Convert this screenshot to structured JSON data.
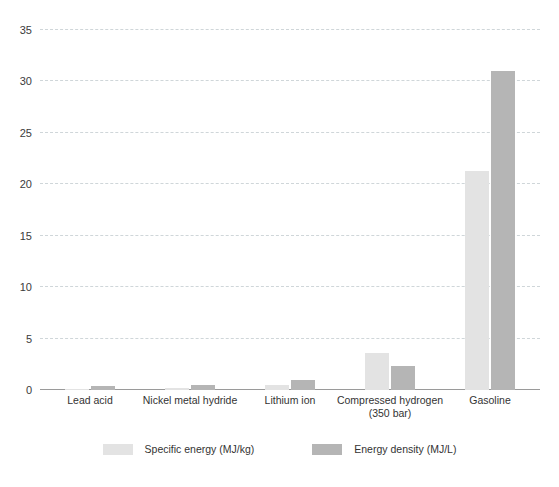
{
  "chart_data": {
    "type": "bar",
    "title": "",
    "subtitle": "",
    "xlabel": "",
    "ylabel": "",
    "ylim": [
      0,
      35
    ],
    "yticks": [
      0,
      5,
      10,
      15,
      20,
      25,
      30,
      35
    ],
    "ytick_labels": [
      "0",
      "5",
      "10",
      "15",
      "20",
      "25",
      "30",
      "35"
    ],
    "grid": true,
    "grid_axis": "y",
    "grid_style": "dashed",
    "legend_position": "bottom",
    "categories": [
      "Lead acid",
      "Nickel metal hydride",
      "Lithium ion",
      "Compressed hydrogen (350 bar)",
      "Gasoline"
    ],
    "category_labels": [
      {
        "line1": "Lead acid",
        "line2": ""
      },
      {
        "line1": "Nickel metal hydride",
        "line2": ""
      },
      {
        "line1": "Lithium ion",
        "line2": ""
      },
      {
        "line1": "Compressed hydrogen",
        "line2": "(350 bar)"
      },
      {
        "line1": "Gasoline",
        "line2": ""
      }
    ],
    "series": [
      {
        "name": "Specific energy (MJ/kg)",
        "color": "#e3e3e3",
        "values": [
          0.14,
          0.22,
          0.46,
          3.6,
          21.3
        ]
      },
      {
        "name": "Energy density (MJ/L)",
        "color": "#b5b5b5",
        "values": [
          0.36,
          0.5,
          1.0,
          2.3,
          31.0
        ]
      }
    ]
  },
  "legend": {
    "items": [
      {
        "label": "Specific energy (MJ/kg)",
        "color": "#e3e3e3"
      },
      {
        "label": "Energy density (MJ/L)",
        "color": "#b5b5b5"
      }
    ]
  },
  "style": {
    "background": "#ffffff",
    "gridline_color": "#cfd6d9",
    "baseline_color": "#9a9a9a",
    "text_color": "#333333"
  }
}
